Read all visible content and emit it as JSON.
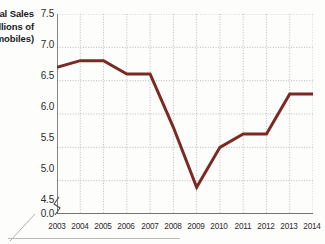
{
  "chart_data": {
    "type": "line",
    "title": "",
    "subtitle": "",
    "xlabel": "",
    "ylabel": "Annual Sales (Millions of Automobiles)",
    "ylabel_visible_lines": [
      "Sales",
      "ons of",
      "obiles)"
    ],
    "categories": [
      "2003",
      "2004",
      "2005",
      "2006",
      "2007",
      "2008",
      "2009",
      "2010",
      "2011",
      "2012",
      "2013",
      "2014"
    ],
    "values": [
      6.7,
      6.8,
      6.8,
      6.6,
      6.6,
      5.8,
      4.9,
      5.5,
      5.7,
      5.7,
      6.3,
      6.3
    ],
    "series": [
      {
        "name": "Annual Sales",
        "values": [
          6.7,
          6.8,
          6.8,
          6.6,
          6.6,
          5.8,
          4.9,
          5.5,
          5.7,
          5.7,
          6.3,
          6.3
        ]
      }
    ],
    "ytick_labels": [
      "7.5",
      "7.0",
      "6.5",
      "6.0",
      "5.5",
      "5.0",
      "4.5",
      "0.0"
    ],
    "ytick_values": [
      7.5,
      7.0,
      6.5,
      6.0,
      5.5,
      5.0,
      4.5,
      0.0
    ],
    "ylim": [
      4.5,
      7.5
    ],
    "y_axis_break": true,
    "y_axis_break_symbol": "axis-break-zigzag",
    "xlim": [
      "2003",
      "2014"
    ],
    "grid": true,
    "grid_style": "dotted",
    "legend": false,
    "legend_position": "none",
    "annotations": [],
    "colors": {
      "line": "#7B2A23",
      "grid": "#9aa0a6",
      "axis": "#4a4a4a",
      "text": "#2b2b2b",
      "background": "#fdfdfc"
    },
    "line_width_px": 3
  },
  "icons": {
    "axis_break": "axis-break-icon"
  }
}
